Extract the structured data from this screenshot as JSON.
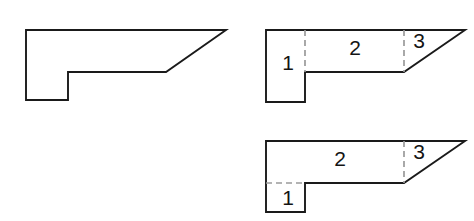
{
  "figure": {
    "canvas": {
      "width": 474,
      "height": 221,
      "background": "#ffffff"
    },
    "style": {
      "outline_color": "#1a1a1a",
      "outline_width": 1.9,
      "dashed_color": "#9a9a9a",
      "dashed_width": 1.7,
      "dash_pattern": "6 4",
      "label_color": "#141414",
      "label_font_size": 21
    }
  },
  "shapes": [
    {
      "id": "original-figure",
      "name": "undivided-polygon",
      "caption": "",
      "points": "26,30 226,30 166,72 68,72 68,100 26,100",
      "dividers": [],
      "labels": []
    },
    {
      "id": "decomposition-a",
      "name": "vertical-split-polygon",
      "caption": "",
      "points": "266,30 465,30 404,72 305,72 305,102 266,102",
      "dividers": [
        {
          "name": "divider-1-2",
          "orientation": "vertical",
          "x1": 305,
          "y1": 30,
          "x2": 305,
          "y2": 72
        },
        {
          "name": "divider-2-3",
          "orientation": "vertical",
          "x1": 404,
          "y1": 30,
          "x2": 404,
          "y2": 72
        }
      ],
      "labels": [
        {
          "name": "region-label-1",
          "text": "1",
          "x": 288,
          "y": 64
        },
        {
          "name": "region-label-2",
          "text": "2",
          "x": 355,
          "y": 49
        },
        {
          "name": "region-label-3",
          "text": "3",
          "x": 419,
          "y": 42
        }
      ]
    },
    {
      "id": "decomposition-b",
      "name": "horizontal-split-polygon",
      "caption": "",
      "points": "266,141 465,141 404,183 305,183 305,212 266,212",
      "dividers": [
        {
          "name": "divider-1-2",
          "orientation": "horizontal",
          "x1": 266,
          "y1": 183,
          "x2": 305,
          "y2": 183
        },
        {
          "name": "divider-2-3",
          "orientation": "vertical",
          "x1": 404,
          "y1": 141,
          "x2": 404,
          "y2": 183
        }
      ],
      "labels": [
        {
          "name": "region-label-2",
          "text": "2",
          "x": 340,
          "y": 160
        },
        {
          "name": "region-label-3",
          "text": "3",
          "x": 419,
          "y": 153
        },
        {
          "name": "region-label-1",
          "text": "1",
          "x": 288,
          "y": 199
        }
      ]
    }
  ]
}
